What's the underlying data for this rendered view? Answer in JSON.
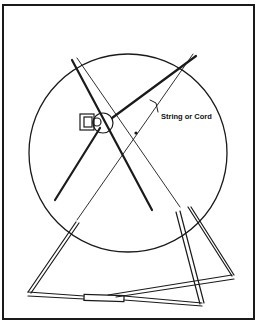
{
  "figure": {
    "callout_label": "String or Cord",
    "components": [
      "wheel",
      "spokes",
      "hub",
      "motor",
      "string",
      "a-frame-stand",
      "base-bar"
    ],
    "colors": {
      "ink": "#1a1a1a",
      "background": "#ffffff"
    }
  }
}
